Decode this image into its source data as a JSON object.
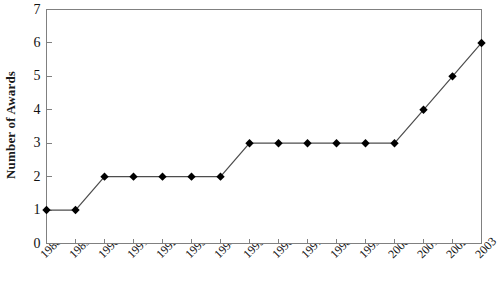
{
  "chart_data": {
    "type": "line",
    "title": "",
    "xlabel": "",
    "ylabel": "Number of Awards",
    "categories": [
      "1988",
      "1989",
      "1990",
      "1991",
      "1992",
      "1993",
      "1994",
      "1995",
      "1996",
      "1997",
      "1998",
      "1999",
      "2000",
      "2001",
      "2002",
      "2003"
    ],
    "values": [
      1,
      1,
      2,
      2,
      2,
      2,
      2,
      3,
      3,
      3,
      3,
      3,
      3,
      4,
      5,
      6
    ],
    "ylim": [
      0,
      7
    ],
    "yticks": [
      "0",
      "1",
      "2",
      "3",
      "4",
      "5",
      "6",
      "7"
    ],
    "grid": false,
    "legend": null,
    "marker": "diamond",
    "series_color": "#000000",
    "line_color": "#4d4d4d",
    "axis_color": "#808080",
    "background": "#ffffff"
  }
}
